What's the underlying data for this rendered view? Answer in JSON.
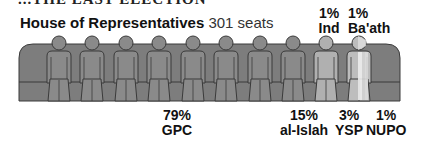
{
  "heading_cut": "...THE LAST ELECTION",
  "chart_data": {
    "type": "pictogram",
    "title": "House of Representatives",
    "subtitle": "301 seats",
    "total_seats": 301,
    "icons": 10,
    "series": [
      {
        "name": "GPC",
        "percent": 79,
        "label": "79%",
        "color": "#8a8a8a"
      },
      {
        "name": "al-Islah",
        "percent": 15,
        "label": "15%",
        "color": "#b0b0b0"
      },
      {
        "name": "YSP",
        "percent": 3,
        "label": "3%",
        "color": "#bdbdbd"
      },
      {
        "name": "NUPO",
        "percent": 1,
        "label": "1%",
        "color": "#e6e6e6"
      },
      {
        "name": "Ind",
        "percent": 1,
        "label": "1%",
        "color": "#cfcfcf"
      },
      {
        "name": "Ba'ath",
        "percent": 1,
        "label": "1%",
        "color": "#d9d9d9"
      }
    ]
  },
  "colors": {
    "bench": "#7d7d7d",
    "outline": "#3a3a3a",
    "figure_dark": "#8a8a8a"
  },
  "labels": {
    "gpc": {
      "pct": "79%",
      "name": "GPC"
    },
    "islah": {
      "pct": "15%",
      "name": "al-Islah"
    },
    "ysp": {
      "pct": "3%",
      "name": "YSP"
    },
    "nupo": {
      "pct": "1%",
      "name": "NUPO"
    },
    "ind": {
      "pct": "1%",
      "name": "Ind"
    },
    "baath": {
      "pct": "1%",
      "name": "Ba'ath"
    }
  }
}
